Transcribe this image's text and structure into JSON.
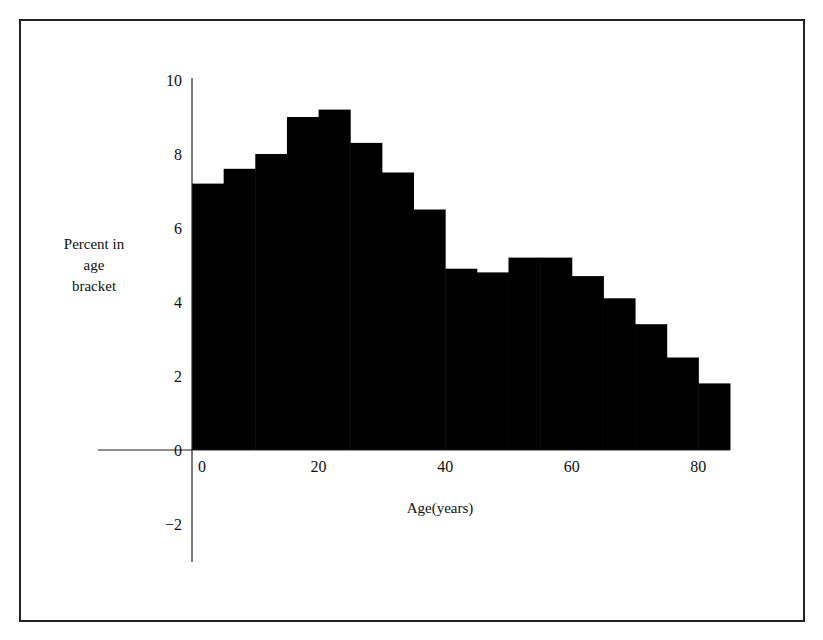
{
  "chart_data": {
    "type": "bar",
    "title": "",
    "xlabel": "Age(years)",
    "ylabel": "Percent in age bracket",
    "ylabel_lines": [
      "Percent in",
      "age",
      "bracket"
    ],
    "categories": [
      "0-5",
      "5-10",
      "10-15",
      "15-20",
      "20-25",
      "25-30",
      "30-35",
      "35-40",
      "40-45",
      "45-50",
      "50-55",
      "55-60",
      "60-65",
      "65-70",
      "70-75",
      "75-80",
      "80-85"
    ],
    "bin_edges": [
      0,
      5,
      10,
      15,
      20,
      25,
      30,
      35,
      40,
      45,
      50,
      55,
      60,
      65,
      70,
      75,
      80,
      85
    ],
    "values": [
      7.2,
      7.6,
      8.0,
      9.0,
      9.2,
      8.3,
      7.5,
      6.5,
      4.9,
      4.8,
      5.2,
      5.2,
      4.7,
      4.1,
      3.4,
      2.5,
      1.8
    ],
    "xlim": [
      0,
      85
    ],
    "ylim": [
      -3,
      10
    ],
    "x_ticks": [
      "0",
      "20",
      "40",
      "60",
      "80"
    ],
    "y_ticks": [
      "10",
      "8",
      "6",
      "4",
      "2",
      "0",
      "-2"
    ],
    "grid": false,
    "legend": null,
    "bar_color": "#000000"
  }
}
